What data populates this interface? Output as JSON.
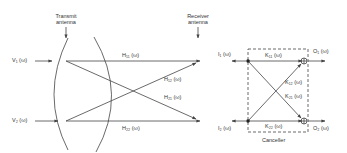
{
  "labels": {
    "transmit_antenna_line1": "Transmit",
    "transmit_antenna_line2": "antenna",
    "receiver_antenna_line1": "Receiver",
    "receiver_antenna_line2": "antenna",
    "v1": "V₁ (ω)",
    "v2": "V₂ (ω)",
    "h11": "H₁₁ (ω)",
    "h12": "H₁₂ (ω)",
    "h21": "H₂₁ (ω)",
    "h22": "H₂₂ (ω)",
    "i1": "I₁ (ω)",
    "i2": "I₂ (ω)",
    "k11": "K₁₁ (ω)",
    "k12": "K₁₂ (ω)",
    "k21": "K₂₁ (ω)",
    "k22": "K₂₂ (ω)",
    "o1": "O₁ (ω)",
    "o2": "O₂ (ω)",
    "canceller": "Canceller"
  },
  "colors": {
    "line": "#444444",
    "text": "#333333",
    "background": "#ffffff"
  }
}
